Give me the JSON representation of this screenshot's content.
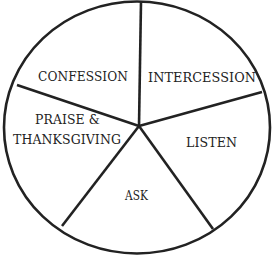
{
  "diagram": {
    "type": "segmented-circle",
    "segment_count": 5,
    "colors": {
      "stroke": "#222222",
      "fill": "#ffffff",
      "text": "#222222"
    },
    "segments": [
      {
        "id": "confession",
        "label": "CONFESSION"
      },
      {
        "id": "intercession",
        "label": "INTERCESSION"
      },
      {
        "id": "listen",
        "label": "LISTEN"
      },
      {
        "id": "ask",
        "label": "ASK"
      },
      {
        "id": "praise-thanksgiving",
        "label_line1": "PRAISE &",
        "label_line2": "THANKSGIVING"
      }
    ]
  }
}
